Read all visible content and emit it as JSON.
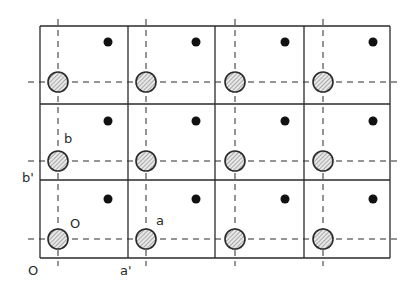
{
  "diagram": {
    "colors": {
      "line": "#2a2a2a",
      "hatch": "#6a6a6a",
      "circle_fill": "#e8e8e8",
      "dot": "#111111",
      "background": "#ffffff"
    },
    "grid": {
      "col_lines_x": [
        40,
        128,
        215,
        304,
        390
      ],
      "row_lines_y": [
        26,
        104,
        180,
        258
      ],
      "dashed_x": [
        58,
        146,
        235,
        323
      ],
      "dashed_y": [
        82,
        161,
        239
      ],
      "circle_radius": 10,
      "dot_radius": 4.5,
      "dot_offset": {
        "dx": 50,
        "dy": -40
      }
    },
    "labels": [
      {
        "id": "b",
        "text": "b",
        "x": 64,
        "y": 132
      },
      {
        "id": "b-prime",
        "text": "b'",
        "x": 22,
        "y": 171
      },
      {
        "id": "O-circle",
        "text": "O",
        "x": 70,
        "y": 217
      },
      {
        "id": "a",
        "text": "a",
        "x": 156,
        "y": 214
      },
      {
        "id": "O-origin",
        "text": "O",
        "x": 28,
        "y": 264
      },
      {
        "id": "a-prime",
        "text": "a'",
        "x": 120,
        "y": 264
      }
    ]
  }
}
